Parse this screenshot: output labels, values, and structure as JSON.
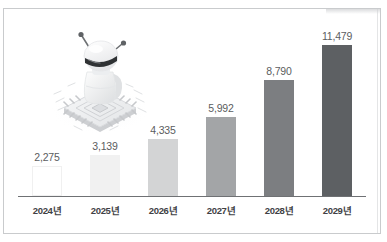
{
  "chart_data": {
    "type": "bar",
    "title": "",
    "subtitle": "",
    "xlabel": "",
    "ylabel": "",
    "categories": [
      "2024년",
      "2025년",
      "2026년",
      "2027년",
      "2028년",
      "2029년"
    ],
    "values": [
      2275,
      3139,
      4335,
      5992,
      8790,
      11479
    ],
    "value_labels": [
      "2,275",
      "3,139",
      "4,335",
      "5,992",
      "8,790",
      "11,479"
    ],
    "ylim": [
      0,
      11479
    ],
    "grid": false,
    "legend": null,
    "legend_position": "none",
    "bar_colors": [
      "#ffffff",
      "#f1f1f1",
      "#d3d4d5",
      "#a3a5a7",
      "#7c7e81",
      "#5d6063"
    ],
    "axis_line_color": "#6f7174",
    "value_label_color": "#5b5d60",
    "tick_label_color": "#3f4144",
    "annotations": []
  },
  "figure": {
    "border_color": "#c9cbcd",
    "background": "#ffffff",
    "illustration": {
      "name": "robot-on-microchip-illustration",
      "description": "isometric white robot sitting on a CPU microchip",
      "parts": [
        "robot-head",
        "robot-visor",
        "robot-antenna-left",
        "robot-antenna-right",
        "robot-body",
        "robot-arm",
        "microchip-base"
      ]
    }
  }
}
